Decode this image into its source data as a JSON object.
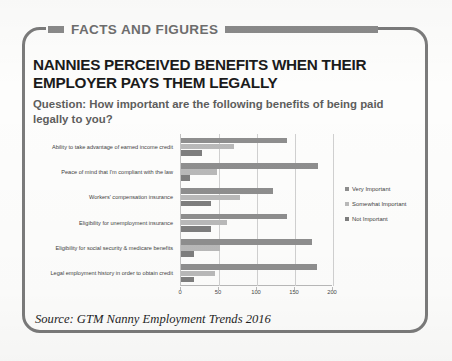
{
  "banner": {
    "label": "FACTS AND FIGURES"
  },
  "headline": "NANNIES PERCEIVED BENEFITS WHEN THEIR EMPLOYER PAYS THEM LEGALLY",
  "question": "Question: How important are the following benefits of being paid legally to you?",
  "source": "Source: GTM Nanny Employment Trends 2016",
  "colors": {
    "banner_gray": "#8a8a8a",
    "headline_black": "#1b1b1b",
    "question_gray": "#5d5d5d",
    "series_very_important": "#8e8e8e",
    "series_somewhat_important": "#b9b9b9",
    "series_not_important": "#7e7e7e",
    "gridline": "#d0d0d0"
  },
  "chart_data": {
    "type": "bar",
    "orientation": "horizontal",
    "title": "",
    "xlabel": "",
    "ylabel": "",
    "xlim": [
      0,
      200
    ],
    "xticks": [
      0,
      50,
      100,
      150,
      200
    ],
    "grid": true,
    "legend_position": "right",
    "categories": [
      "Ability to take advantage of earned income credit",
      "Peace of mind that I'm compliant with the law",
      "Workers' compensation insurance",
      "Eligibility for unemployment insurance",
      "Eligibility for social security & medicare benefits",
      "Legal employment history in order to obtain credit"
    ],
    "series": [
      {
        "name": "Very Important",
        "values": [
          140,
          180,
          121,
          139,
          173,
          179
        ]
      },
      {
        "name": "Somewhat Important",
        "values": [
          70,
          47,
          77,
          60,
          51,
          45
        ]
      },
      {
        "name": "Not Important",
        "values": [
          28,
          12,
          39,
          39,
          17,
          17
        ]
      }
    ]
  }
}
